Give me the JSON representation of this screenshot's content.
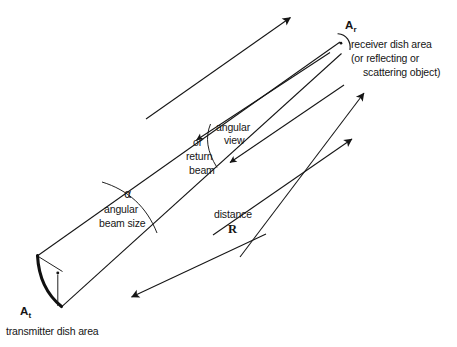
{
  "figure": {
    "width": 457,
    "height": 347,
    "ink_color": "#151515",
    "background_color": "#ffffff"
  },
  "labels": {
    "receiver_symbol": "A",
    "receiver_symbol_sub": "r",
    "receiver_line1": "receiver dish area",
    "receiver_line2": "(or reflecting or",
    "receiver_line3": "scattering object)",
    "transmitter_symbol": "A",
    "transmitter_symbol_sub": "t",
    "transmitter_caption": "transmitter dish area",
    "alpha_symbol": "α",
    "alpha_line1": "angular",
    "alpha_line2": "beam size",
    "view_line1": "angular",
    "view_line2": "view",
    "return_line1": "or",
    "return_line2": "return",
    "return_line3": "beam",
    "distance_label": "distance",
    "distance_symbol": "R"
  },
  "annotations": {
    "outgoing_beam": "outgoing transmitted beam envelope",
    "return_beam": "return / angular view beam envelope",
    "distance_measure": "distance R between transmitter and receiver"
  }
}
